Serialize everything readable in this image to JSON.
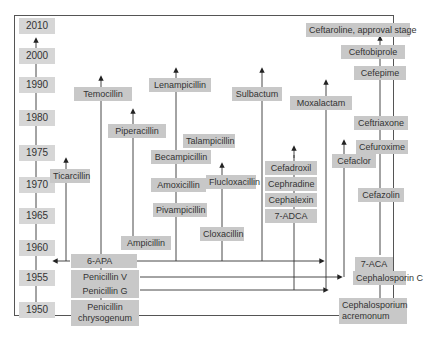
{
  "diagram": {
    "title": "",
    "years": [
      "2010",
      "2000",
      "1990",
      "1980",
      "1975",
      "1970",
      "1965",
      "1960",
      "1955",
      "1950"
    ],
    "penicillins": {
      "source": "Penicillin chrysogenum",
      "source_line1": "Penicillin",
      "source_line2": "chrysogenum",
      "penicillin_g": "Penicillin G",
      "penicillin_v": "Penicillin V",
      "six_apa": "6-APA",
      "derivatives": [
        "Ticarcillin",
        "Temocillin",
        "Piperacillin",
        "Ampicillin",
        "Lenampicillin",
        "Talampicillin",
        "Becampicillin",
        "Amoxicillin",
        "Pivampicillin",
        "Flucloxacillin",
        "Cloxacillin",
        "Sulbactum",
        "Moxalactam"
      ]
    },
    "cephalosporins": {
      "source": "Cephalosporium acremonum",
      "source_line1": "Cephalosporium",
      "source_line2": "acremonum",
      "cephalosporin_c": "Cephalosporin C",
      "seven_aca": "7-ACA",
      "seven_adca": "7-ADCA",
      "adca_derivatives": [
        "Cephalexin",
        "Cephradine",
        "Cefadroxil"
      ],
      "cefaclor": "Cefaclor",
      "aca_derivatives": [
        "Cefazolin",
        "Cefuroxime",
        "Ceftriaxone",
        "Cefepime",
        "Ceftobiprole",
        "Ceftaroline, approval stage"
      ]
    }
  }
}
